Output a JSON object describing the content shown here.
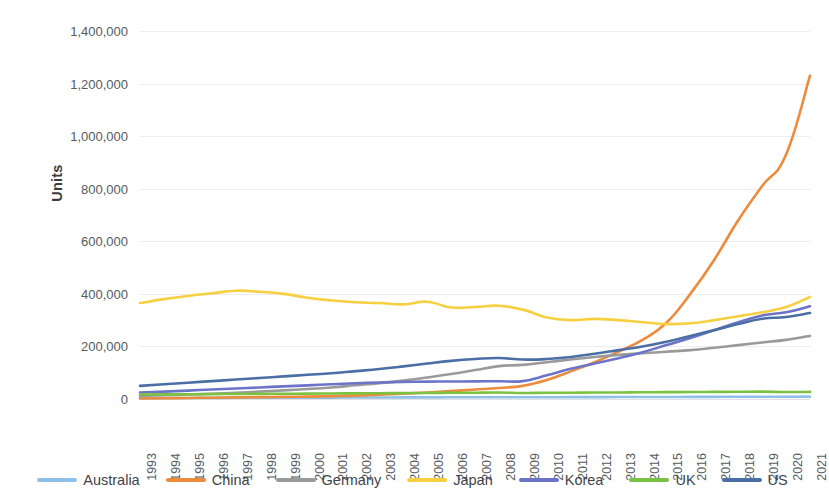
{
  "chart_data": {
    "type": "line",
    "title": "",
    "xlabel": "",
    "ylabel": "Units",
    "ylim": [
      0,
      1400000
    ],
    "ytick_step": 200000,
    "grid": true,
    "legend_position": "bottom",
    "categories": [
      "1993",
      "1994",
      "1995",
      "1996",
      "1997",
      "1998",
      "1999",
      "2000",
      "2001",
      "2002",
      "2003",
      "2004",
      "2005",
      "2006",
      "2007",
      "2008",
      "2009",
      "2010",
      "2011",
      "2012",
      "2013",
      "2014",
      "2015",
      "2016",
      "2017",
      "2018",
      "2019",
      "2020",
      "2021"
    ],
    "y_ticks": [
      "0",
      "200,000",
      "400,000",
      "600,000",
      "800,000",
      "1,000,000",
      "1,200,000",
      "1,400,000"
    ],
    "series": [
      {
        "name": "Australia",
        "color": "#8fc1e8",
        "values": [
          3000,
          3500,
          4000,
          4200,
          4500,
          4800,
          5000,
          5200,
          5400,
          5600,
          5800,
          6000,
          6200,
          6400,
          6600,
          6800,
          6500,
          6800,
          7000,
          7200,
          7400,
          7600,
          7800,
          8000,
          8200,
          8400,
          8600,
          8500,
          9000
        ]
      },
      {
        "name": "China",
        "color": "#ed8b3c",
        "values": [
          2000,
          3000,
          4000,
          5000,
          6000,
          7000,
          8000,
          9000,
          11000,
          13000,
          16000,
          20000,
          25000,
          30000,
          36000,
          42000,
          50000,
          72000,
          105000,
          140000,
          180000,
          225000,
          290000,
          400000,
          530000,
          680000,
          810000,
          930000,
          1230000
        ]
      },
      {
        "name": "Germany",
        "color": "#9a9a9a",
        "values": [
          12000,
          14000,
          17000,
          20000,
          24000,
          28000,
          33000,
          38000,
          44000,
          52000,
          60000,
          70000,
          82000,
          95000,
          110000,
          125000,
          130000,
          140000,
          150000,
          160000,
          168000,
          174000,
          180000,
          186000,
          195000,
          205000,
          215000,
          225000,
          240000
        ]
      },
      {
        "name": "Japan",
        "color": "#f6d040",
        "values": [
          365000,
          380000,
          392000,
          402000,
          412000,
          408000,
          400000,
          385000,
          375000,
          368000,
          365000,
          360000,
          370000,
          348000,
          350000,
          355000,
          340000,
          310000,
          300000,
          305000,
          300000,
          292000,
          285000,
          288000,
          300000,
          315000,
          330000,
          350000,
          388000
        ]
      },
      {
        "name": "Korea",
        "color": "#6c74c8",
        "values": [
          25000,
          28000,
          32000,
          36000,
          40000,
          44000,
          48000,
          52000,
          56000,
          60000,
          63000,
          65000,
          66000,
          66500,
          67000,
          67500,
          68000,
          90000,
          115000,
          135000,
          155000,
          178000,
          205000,
          232000,
          262000,
          292000,
          318000,
          330000,
          353000
        ]
      },
      {
        "name": "UK",
        "color": "#7cc242",
        "values": [
          17000,
          17500,
          18000,
          18500,
          19000,
          19500,
          20000,
          20500,
          21000,
          21500,
          22000,
          22500,
          23000,
          23500,
          24000,
          24500,
          23000,
          23500,
          24000,
          24500,
          25000,
          25500,
          26000,
          26500,
          27000,
          27500,
          28000,
          26500,
          27000
        ]
      },
      {
        "name": "US",
        "color": "#4a6fa5",
        "values": [
          50000,
          56000,
          62000,
          68000,
          74000,
          80000,
          86000,
          92000,
          98000,
          106000,
          114000,
          124000,
          135000,
          145000,
          152000,
          156000,
          150000,
          152000,
          160000,
          172000,
          186000,
          200000,
          218000,
          240000,
          262000,
          285000,
          305000,
          312000,
          327000
        ]
      }
    ]
  },
  "legend": {
    "items": [
      {
        "label": "Australia",
        "color": "#8fc1e8"
      },
      {
        "label": "China",
        "color": "#ed8b3c"
      },
      {
        "label": "Germany",
        "color": "#9a9a9a"
      },
      {
        "label": "Japan",
        "color": "#f6d040"
      },
      {
        "label": "Korea",
        "color": "#6c74c8"
      },
      {
        "label": "UK",
        "color": "#7cc242"
      },
      {
        "label": "US",
        "color": "#4a6fa5"
      }
    ]
  }
}
